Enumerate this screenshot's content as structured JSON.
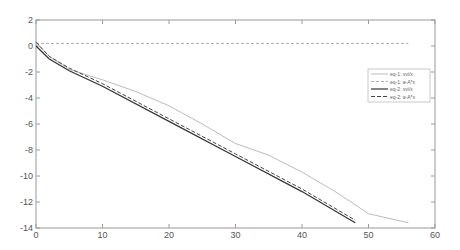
{
  "chart_data": {
    "type": "line",
    "title": "",
    "xlabel": "",
    "ylabel": "",
    "xlim": [
      0,
      60
    ],
    "ylim": [
      -14,
      2
    ],
    "xticks": [
      0,
      10,
      20,
      30,
      40,
      50,
      60
    ],
    "yticks": [
      2,
      0,
      -2,
      -4,
      -6,
      -8,
      -10,
      -12,
      -14
    ],
    "grid": false,
    "legend_position": "upper right",
    "series": [
      {
        "name": "eq-1: xvi/x",
        "style": "solid-light",
        "color": "#aaaaaa",
        "x": [
          0,
          2,
          5,
          10,
          15,
          20,
          25,
          30,
          35,
          40,
          45,
          50,
          56
        ],
        "y": [
          0.3,
          -0.8,
          -1.8,
          -2.6,
          -3.5,
          -4.6,
          -6.0,
          -7.5,
          -8.4,
          -9.7,
          -11.2,
          -12.9,
          -13.6
        ]
      },
      {
        "name": "eq-1: a-A*x",
        "style": "dashed-light",
        "color": "#999999",
        "x": [
          0,
          56
        ],
        "y": [
          0.2,
          0.2
        ]
      },
      {
        "name": "eq-2: xvi/x",
        "style": "solid-dark",
        "color": "#333333",
        "x": [
          0,
          2,
          5,
          10,
          20,
          30,
          40,
          48
        ],
        "y": [
          0.0,
          -1.0,
          -1.9,
          -3.1,
          -5.8,
          -8.5,
          -11.2,
          -13.6
        ]
      },
      {
        "name": "eq-2: a-A*x",
        "style": "dashed-dark",
        "color": "#444444",
        "x": [
          0,
          2,
          5,
          10,
          20,
          30,
          40,
          48
        ],
        "y": [
          0.3,
          -0.8,
          -1.7,
          -2.9,
          -5.6,
          -8.3,
          -11.0,
          -13.4
        ]
      }
    ]
  }
}
